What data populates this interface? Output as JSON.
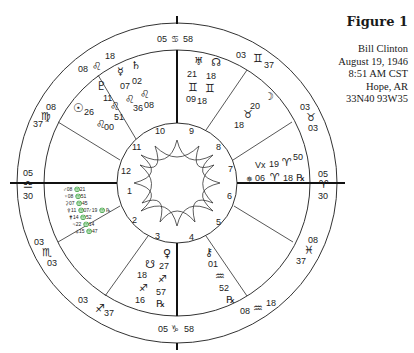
{
  "figure": {
    "title": "Figure 1",
    "subject": "Bill Clinton",
    "date": "August 19, 1946",
    "time": "8:51 AM CST",
    "place": "Hope, AR",
    "coordinates": "33N40 93W35"
  },
  "chart": {
    "center": [
      177,
      183
    ],
    "outer_radius": 160,
    "middle_radius": 133,
    "inner_radius": 60,
    "house_numbers": [
      "1",
      "2",
      "3",
      "4",
      "5",
      "6",
      "7",
      "8",
      "9",
      "10",
      "11",
      "12"
    ],
    "cusps": [
      {
        "house": "10 (MC)",
        "deg": "05",
        "sign": "♋",
        "min": "58"
      },
      {
        "house": "11",
        "deg": "03",
        "sign": "♊",
        "min": "37"
      },
      {
        "house": "12",
        "deg": "03",
        "sign": "♉",
        "min": "03"
      },
      {
        "house": "1 (Asc)",
        "deg": "05",
        "sign": "♈",
        "min": "30"
      },
      {
        "house": "2",
        "deg": "08",
        "sign": "♓",
        "min": "37"
      },
      {
        "house": "3",
        "deg": "08",
        "sign": "♒",
        "min": "18"
      },
      {
        "house": "4 (IC)",
        "deg": "05",
        "sign": "♑",
        "min": "58"
      },
      {
        "house": "5",
        "deg": "03",
        "sign": "♐",
        "min": "37"
      },
      {
        "house": "6",
        "deg": "03",
        "sign": "♏",
        "min": "03"
      },
      {
        "house": "7 (Desc)",
        "deg": "05",
        "sign": "♎",
        "min": "30"
      },
      {
        "house": "8",
        "deg": "08",
        "sign": "♍",
        "min": "37"
      },
      {
        "house": "9",
        "deg": "08",
        "sign": "♌",
        "min": "18"
      }
    ],
    "planets": [
      {
        "name": "Uranus",
        "glyph": "♅",
        "deg": "21",
        "sign": "♊",
        "min": "09"
      },
      {
        "name": "North Node",
        "glyph": "☊",
        "deg": "18",
        "sign": "♊",
        "min": "18"
      },
      {
        "name": "Moon",
        "glyph": "☽",
        "deg": "20",
        "sign": "♉",
        "min": "18"
      },
      {
        "name": "Vertex",
        "glyph": "Vx",
        "deg": "19",
        "sign": "♈",
        "min": "50"
      },
      {
        "name": "Eris",
        "glyph": "✵",
        "deg": "06",
        "sign": "♈",
        "min": "18",
        "retro": "℞"
      },
      {
        "name": "Chiron",
        "glyph": "⚷",
        "deg": "01",
        "sign": "♒",
        "min": "52",
        "retro": "℞"
      },
      {
        "name": "Venus",
        "glyph": "♀",
        "deg": "27",
        "sign": "♐",
        "min": "57"
      },
      {
        "name": "South Node",
        "glyph": "☋",
        "deg": "18",
        "sign": "♐",
        "min": "16",
        "retro": "℞"
      },
      {
        "name": "Pluto",
        "glyph": "♇",
        "deg": "11",
        "sign": "♌",
        "min": "51"
      },
      {
        "name": "Sun",
        "glyph": "☉",
        "deg": "26",
        "sign": "♌",
        "min": "00"
      },
      {
        "name": "Mercury",
        "glyph": "☿",
        "deg": "07",
        "sign": "♌",
        "min": "36"
      },
      {
        "name": "Saturn",
        "glyph": "♄",
        "deg": "02",
        "sign": "♌",
        "min": "08"
      }
    ],
    "house7_list": [
      "♂08 ♎21",
      "♆08 ♎51",
      "⚳07 ♎45",
      "⚴11 ♎07",
      "⚵14 ♎52",
      "♃22 ♎14",
      "⚶15 ♎47"
    ],
    "house7_extra": "♂19 ♎ ℞"
  }
}
